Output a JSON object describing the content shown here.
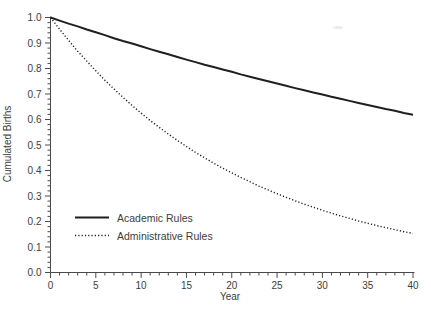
{
  "colors": {
    "background": "#ffffff",
    "line": "#1f1f1f",
    "axis": "#4a4a4a",
    "text": "#3d3d3d"
  },
  "chart_data": {
    "type": "line",
    "title": "",
    "xlabel": "Year",
    "ylabel": "Cumulated Births",
    "xlim": [
      0,
      40
    ],
    "ylim": [
      0.0,
      1.0
    ],
    "grid": false,
    "legend_position": "lower-left",
    "x_major_ticks": [
      0,
      5,
      10,
      15,
      20,
      25,
      30,
      35,
      40
    ],
    "x_tick_labels": [
      "0",
      "5",
      "10",
      "15",
      "20",
      "25",
      "30",
      "35",
      "40"
    ],
    "x_minor_step": 1,
    "y_major_ticks": [
      0.0,
      0.1,
      0.2,
      0.3,
      0.4,
      0.5,
      0.6,
      0.7,
      0.8,
      0.9,
      1.0
    ],
    "y_tick_labels": [
      "0.0",
      "0.1",
      "0.2",
      "0.3",
      "0.4",
      "0.5",
      "0.6",
      "0.7",
      "0.8",
      "0.9",
      "1.0"
    ],
    "y_minor_step": 0.02,
    "x": [
      0,
      1,
      2,
      3,
      4,
      5,
      6,
      7,
      8,
      9,
      10,
      11,
      12,
      13,
      14,
      15,
      16,
      17,
      18,
      19,
      20,
      21,
      22,
      23,
      24,
      25,
      26,
      27,
      28,
      29,
      30,
      31,
      32,
      33,
      34,
      35,
      36,
      37,
      38,
      39,
      40
    ],
    "series": [
      {
        "name": "Academic Rules",
        "style": "solid",
        "values": [
          1.0,
          0.988,
          0.976,
          0.965,
          0.953,
          0.942,
          0.931,
          0.919,
          0.908,
          0.898,
          0.887,
          0.876,
          0.866,
          0.856,
          0.845,
          0.835,
          0.825,
          0.815,
          0.806,
          0.796,
          0.787,
          0.777,
          0.768,
          0.759,
          0.75,
          0.741,
          0.732,
          0.723,
          0.715,
          0.706,
          0.698,
          0.689,
          0.681,
          0.673,
          0.665,
          0.657,
          0.649,
          0.641,
          0.634,
          0.626,
          0.619
        ]
      },
      {
        "name": "Administrative Rules",
        "style": "dotted",
        "values": [
          1.0,
          0.954,
          0.91,
          0.868,
          0.829,
          0.791,
          0.754,
          0.72,
          0.687,
          0.655,
          0.625,
          0.596,
          0.569,
          0.543,
          0.518,
          0.494,
          0.471,
          0.45,
          0.429,
          0.409,
          0.391,
          0.373,
          0.356,
          0.339,
          0.324,
          0.309,
          0.295,
          0.281,
          0.268,
          0.256,
          0.244,
          0.233,
          0.222,
          0.212,
          0.202,
          0.193,
          0.184,
          0.176,
          0.168,
          0.16,
          0.153
        ]
      }
    ]
  }
}
